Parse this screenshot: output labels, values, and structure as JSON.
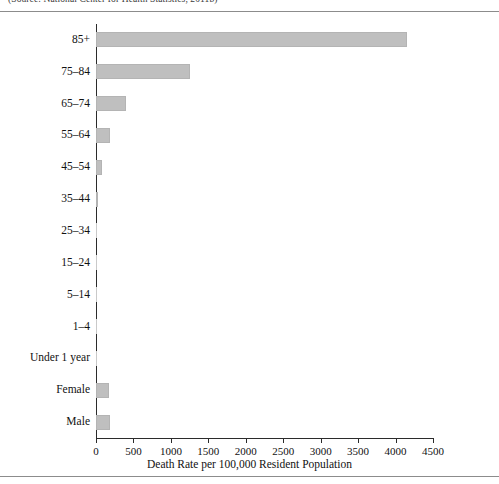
{
  "figure": {
    "source_note": "(Source: National Center for Health Statistics, 2011b)"
  },
  "chart_data": {
    "type": "bar",
    "orientation": "horizontal",
    "title": "",
    "xlabel": "Death Rate per 100,000 Resident Population",
    "ylabel": "",
    "xlim": [
      0,
      4500
    ],
    "xticks": [
      0,
      500,
      1000,
      1500,
      2000,
      2500,
      3000,
      3500,
      4000,
      4500
    ],
    "xtick_labels": [
      "0",
      "500",
      "1000",
      "1500",
      "2000",
      "2500",
      "3000",
      "3500",
      "4000",
      "4500"
    ],
    "grid": false,
    "legend": null,
    "bar_color": "#bfbfbf",
    "categories": [
      "85+",
      "75–84",
      "65–74",
      "55–64",
      "45–54",
      "35–44",
      "25–34",
      "15–24",
      "5–14",
      "1–4",
      "Under 1 year",
      "Female",
      "Male"
    ],
    "values": [
      4150,
      1250,
      400,
      190,
      80,
      20,
      5,
      3,
      2,
      3,
      6,
      180,
      190
    ]
  }
}
